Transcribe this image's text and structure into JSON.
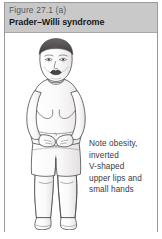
{
  "figure": {
    "number": "Figure 27.1 (a)",
    "title": "Prader–Willi syndrome",
    "caption_lines": [
      "Note obesity,",
      "inverted",
      "V-shaped",
      "upper lips and",
      "small hands"
    ],
    "caption_full": "Note obesity, inverted V-shaped upper lips and small hands",
    "illustration_alt": "Line drawing of a child with Prader-Willi syndrome standing facing forward, obese torso, hands clasped at the abdomen, wearing shorts, bare feet",
    "colors": {
      "header_background": "#c9c9c9",
      "header_number_text": "#59595c",
      "header_title_text": "#18181a",
      "caption_text": "#3a3a3c",
      "border": "#9a9a9a",
      "page_background": "#ffffff",
      "line_art_stroke": "#4a4a4c",
      "hair": "#4c4a4a",
      "skin_shade": "#efeced"
    }
  }
}
